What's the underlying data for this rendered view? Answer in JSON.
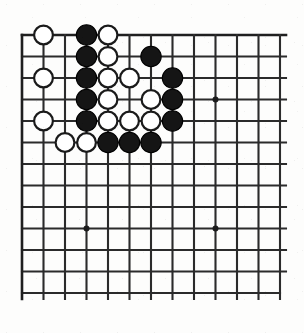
{
  "figure": {
    "kind": "go-board-diagram",
    "board": {
      "columns": 13,
      "rows": 13,
      "origin_x": 22,
      "origin_y": 35,
      "spacing": 21.5,
      "edges": {
        "top": true,
        "left": true,
        "bottom": false,
        "right": false
      },
      "line_color": "#2b2b2b",
      "background_color": "#fdfdfc"
    },
    "star_points": [
      {
        "col": 3,
        "row": 9
      },
      {
        "col": 9,
        "row": 3
      },
      {
        "col": 9,
        "row": 9
      }
    ],
    "stone_radius": 10.2,
    "colors": {
      "black_stone": "#151515",
      "white_stone": "#ffffff",
      "stone_outline": "#1a1a1a"
    },
    "stones": [
      {
        "col": 1,
        "row": 0,
        "color": "white"
      },
      {
        "col": 3,
        "row": 0,
        "color": "black"
      },
      {
        "col": 4,
        "row": 0,
        "color": "white"
      },
      {
        "col": 3,
        "row": 1,
        "color": "black"
      },
      {
        "col": 4,
        "row": 1,
        "color": "white"
      },
      {
        "col": 6,
        "row": 1,
        "color": "black"
      },
      {
        "col": 1,
        "row": 2,
        "color": "white"
      },
      {
        "col": 3,
        "row": 2,
        "color": "black"
      },
      {
        "col": 4,
        "row": 2,
        "color": "white"
      },
      {
        "col": 5,
        "row": 2,
        "color": "white"
      },
      {
        "col": 7,
        "row": 2,
        "color": "black"
      },
      {
        "col": 3,
        "row": 3,
        "color": "black"
      },
      {
        "col": 4,
        "row": 3,
        "color": "white"
      },
      {
        "col": 6,
        "row": 3,
        "color": "white"
      },
      {
        "col": 7,
        "row": 3,
        "color": "black"
      },
      {
        "col": 1,
        "row": 4,
        "color": "white"
      },
      {
        "col": 3,
        "row": 4,
        "color": "black"
      },
      {
        "col": 4,
        "row": 4,
        "color": "white"
      },
      {
        "col": 5,
        "row": 4,
        "color": "white"
      },
      {
        "col": 6,
        "row": 4,
        "color": "white"
      },
      {
        "col": 7,
        "row": 4,
        "color": "black"
      },
      {
        "col": 2,
        "row": 5,
        "color": "white"
      },
      {
        "col": 3,
        "row": 5,
        "color": "white"
      },
      {
        "col": 4,
        "row": 5,
        "color": "black"
      },
      {
        "col": 5,
        "row": 5,
        "color": "black"
      },
      {
        "col": 6,
        "row": 5,
        "color": "black"
      }
    ],
    "counts": {
      "black_stones": 13,
      "white_stones": 13,
      "total_stones": 26
    }
  }
}
